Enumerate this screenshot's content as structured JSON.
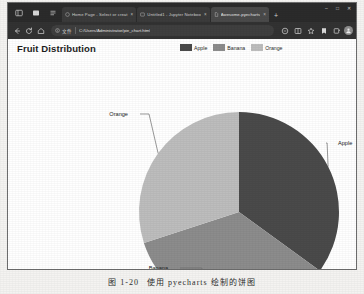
{
  "browser": {
    "window_controls": [
      "minimize",
      "maximize",
      "close"
    ],
    "tab_strip": {
      "left_icons": [
        "tab-actions-icon",
        "tab-vertical-icon",
        "tab-search-icon"
      ],
      "new_tab_label": "+",
      "tabs": [
        {
          "title": "Home Page - Select or creat",
          "favicon": "globe-icon",
          "active": false,
          "close_label": "×"
        },
        {
          "title": "Untitled1 - Jupyter Noteboo",
          "favicon": "jupyter-icon",
          "active": false,
          "close_label": "×"
        },
        {
          "title": "Awesome-pyecharts",
          "favicon": "file-icon",
          "active": true,
          "close_label": "×"
        }
      ]
    },
    "toolbar": {
      "back_label": "←",
      "forward_label": "→",
      "refresh_label": "↻",
      "home_label": "home-icon",
      "address": {
        "info_icon": "info-circle-icon",
        "scheme_label": "文件",
        "url": "C:/Users/Administrator/pie_chart.html"
      },
      "right_icons": [
        "reading-mode-icon",
        "split-screen-icon",
        "favorite-star-icon",
        "collections-icon",
        "browser-essentials-icon"
      ],
      "profile": "avatar"
    }
  },
  "page": {
    "title": "Fruit Distribution",
    "legend_position": "top-right"
  },
  "chart_data": {
    "type": "pie",
    "title": "Fruit Distribution",
    "categories": [
      "Apple",
      "Banana",
      "Orange"
    ],
    "values": [
      35,
      35,
      30
    ],
    "labels": [
      "Apple",
      "Banana",
      "Orange"
    ],
    "colors": [
      "#4a4a4a",
      "#8c8c8c",
      "#bdbdbd"
    ],
    "legend": [
      "Apple",
      "Banana",
      "Orange"
    ],
    "label_lines": true,
    "start_angle": 90,
    "direction": "clockwise",
    "xlabel": "",
    "ylabel": "",
    "grid": false
  },
  "caption": {
    "number": "图 1-20",
    "text": "使用 pyecharts 绘制的饼图"
  }
}
